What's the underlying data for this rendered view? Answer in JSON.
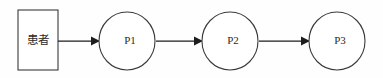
{
  "diagram": {
    "type": "flowchart",
    "orientation": "left-to-right",
    "background_color": "#fefefe",
    "stroke_color": "#3a3a3a",
    "arrow_color": "#1d1d1d",
    "text_color": "#2a2a2a",
    "nodes": [
      {
        "id": "patient",
        "shape": "rectangle",
        "label": "患者",
        "cx": 38,
        "cy": 40,
        "width": 40,
        "height": 60
      },
      {
        "id": "p1",
        "shape": "circle",
        "label": "P1",
        "cx": 127,
        "cy": 41,
        "rx": 28,
        "ry": 29
      },
      {
        "id": "p2",
        "shape": "circle",
        "label": "P2",
        "cx": 230,
        "cy": 41,
        "rx": 28,
        "ry": 29
      },
      {
        "id": "p3",
        "shape": "circle",
        "label": "P3",
        "cx": 337,
        "cy": 41,
        "rx": 28,
        "ry": 29
      }
    ],
    "edges": [
      {
        "id": "edge-patient-p1",
        "from": "patient",
        "to": "p1",
        "label": "",
        "x1": 58,
        "x2": 99,
        "y": 41
      },
      {
        "id": "edge-p1-p2",
        "from": "p1",
        "to": "p2",
        "label": "",
        "x1": 156,
        "x2": 202,
        "y": 41
      },
      {
        "id": "edge-p2-p3",
        "from": "p2",
        "to": "p3",
        "label": "",
        "x1": 259,
        "x2": 309,
        "y": 41
      }
    ]
  }
}
